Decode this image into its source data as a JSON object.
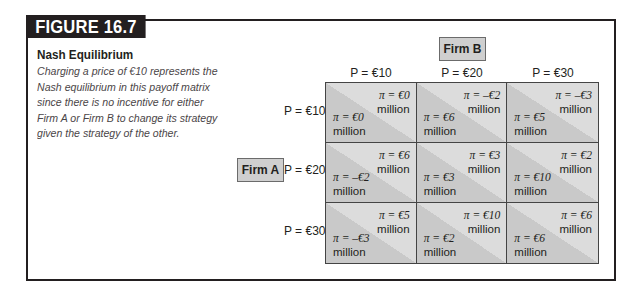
{
  "figure": {
    "tag": "FIGURE 16.7",
    "title": "Nash Equilibrium",
    "caption": "Charging a price of €10 represents the Nash equilibrium in this payoff matrix since there is no incentive for either Firm A or Firm B to change its strategy given the strategy of the other."
  },
  "players": {
    "column_player": "Firm B",
    "row_player": "Firm A"
  },
  "columns": [
    "P = €10",
    "P = €20",
    "P = €30"
  ],
  "rows": [
    "P = €10",
    "P = €20",
    "P = €30"
  ],
  "unit": "million",
  "matrix": [
    [
      {
        "firm_b": "π = €0",
        "firm_a": "π = €0"
      },
      {
        "firm_b": "π = –€2",
        "firm_a": "π = €6"
      },
      {
        "firm_b": "π = –€3",
        "firm_a": "π = €5"
      }
    ],
    [
      {
        "firm_b": "π = €6",
        "firm_a": "π = –€2"
      },
      {
        "firm_b": "π = €3",
        "firm_a": "π = €3"
      },
      {
        "firm_b": "π = €2",
        "firm_a": "π = €10"
      }
    ],
    [
      {
        "firm_b": "π = €5",
        "firm_a": "π = –€3"
      },
      {
        "firm_b": "π = €10",
        "firm_a": "π = €2"
      },
      {
        "firm_b": "π = €6",
        "firm_a": "π = €6"
      }
    ]
  ],
  "colors": {
    "cell_dark": "#c9c9c9",
    "cell_light": "#dcdcdc",
    "tag_bg": "#231f20",
    "firm_box_bg": "#cfcfcf"
  }
}
